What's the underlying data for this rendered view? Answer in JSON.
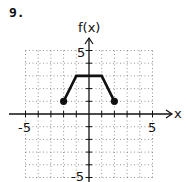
{
  "problem_number": "9.",
  "chart_data": {
    "type": "line",
    "title": "",
    "xlabel": "x",
    "ylabel": "f(x)",
    "xlim": [
      -5,
      5
    ],
    "ylim": [
      -5,
      5
    ],
    "grid": true,
    "x_tick_labels": [
      "-5",
      "5"
    ],
    "y_tick_labels": [
      "5",
      "-5"
    ],
    "series": [
      {
        "name": "f(x)",
        "points": [
          [
            -2,
            1
          ],
          [
            -1,
            3
          ],
          [
            1,
            3
          ],
          [
            2,
            1
          ]
        ],
        "endpoints_closed": [
          [
            -2,
            1
          ],
          [
            2,
            1
          ]
        ]
      }
    ]
  },
  "labels": {
    "y_axis": "f(x)",
    "x_axis": "x",
    "x_neg": "-5",
    "x_pos": "5",
    "y_pos": "5",
    "y_neg": "-5"
  }
}
